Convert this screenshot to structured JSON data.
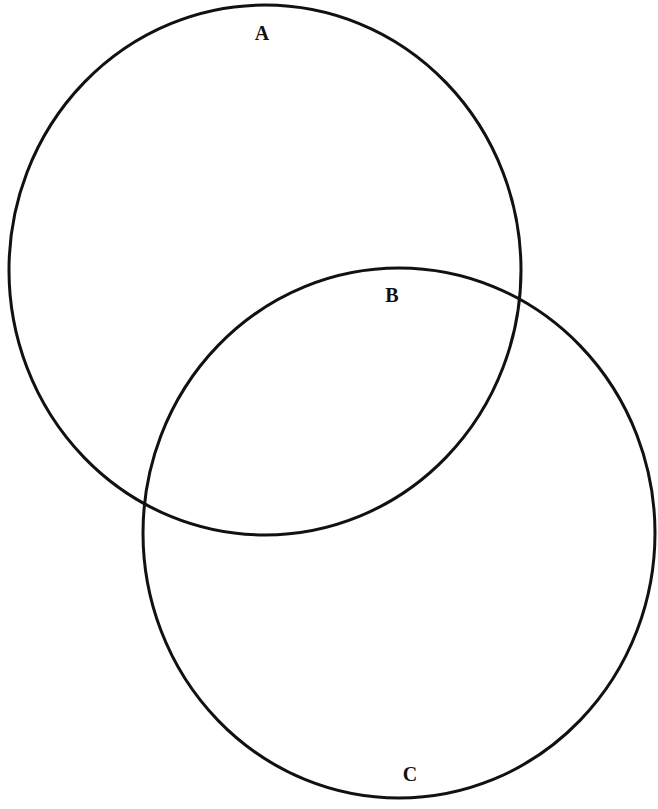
{
  "diagram": {
    "type": "venn",
    "stroke_color": "#111111",
    "background": "#ffffff",
    "circles": [
      {
        "id": "A",
        "cx": 265,
        "cy": 270,
        "rx": 256,
        "ry": 265
      },
      {
        "id": "C",
        "cx": 399,
        "cy": 533,
        "rx": 256,
        "ry": 265
      }
    ],
    "labels": [
      {
        "id": "label-a",
        "text": "A",
        "x": 262,
        "y": 40
      },
      {
        "id": "label-b",
        "text": "B",
        "x": 392,
        "y": 302
      },
      {
        "id": "label-c",
        "text": "C",
        "x": 410,
        "y": 781
      }
    ]
  }
}
